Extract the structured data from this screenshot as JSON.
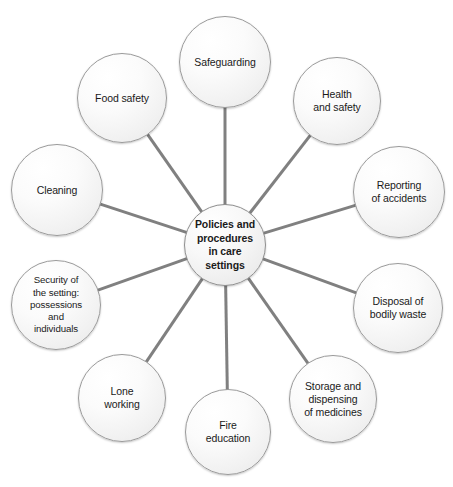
{
  "diagram": {
    "type": "hub-and-spoke-mind-map",
    "center": {
      "id": "center-policies",
      "label": "Policies and\nprocedures\nin care\nsettings",
      "plain_label": "Policies and procedures in care settings",
      "bold": true,
      "cx": 225,
      "cy": 245,
      "r": 41
    },
    "nodes": [
      {
        "id": "safeguarding",
        "label": "Safeguarding",
        "cx": 225,
        "cy": 62,
        "r": 46,
        "angle_deg": 90
      },
      {
        "id": "health-and-safety",
        "label": "Health\nand safety",
        "cx": 337,
        "cy": 101,
        "r": 44,
        "angle_deg": 54
      },
      {
        "id": "reporting-of-accidents",
        "label": "Reporting\nof accidents",
        "cx": 399,
        "cy": 192,
        "r": 46,
        "angle_deg": 18
      },
      {
        "id": "disposal-of-bodily-waste",
        "label": "Disposal of\nbodily waste",
        "cx": 398,
        "cy": 308,
        "r": 45,
        "angle_deg": -18
      },
      {
        "id": "storage-and-dispensing-of-medicines",
        "label": "Storage and\ndispensing\nof medicines",
        "cx": 333,
        "cy": 399,
        "r": 44,
        "angle_deg": -54
      },
      {
        "id": "fire-education",
        "label": "Fire\neducation",
        "cx": 228,
        "cy": 432,
        "r": 43,
        "angle_deg": -90
      },
      {
        "id": "lone-working",
        "label": "Lone\nworking",
        "cx": 122,
        "cy": 398,
        "r": 44,
        "angle_deg": -126
      },
      {
        "id": "security-of-the-setting",
        "label": "Security of\nthe setting:\npossessions\nand\nindividuals",
        "cx": 56,
        "cy": 305,
        "r": 45,
        "angle_deg": -162,
        "small_text": true
      },
      {
        "id": "cleaning",
        "label": "Cleaning",
        "cx": 57,
        "cy": 190,
        "r": 46,
        "angle_deg": 162
      },
      {
        "id": "food-safety",
        "label": "Food safety",
        "cx": 122,
        "cy": 98,
        "r": 45,
        "angle_deg": 126
      }
    ],
    "edges": [
      {
        "from": "center-policies",
        "to": "safeguarding"
      },
      {
        "from": "center-policies",
        "to": "health-and-safety"
      },
      {
        "from": "center-policies",
        "to": "reporting-of-accidents"
      },
      {
        "from": "center-policies",
        "to": "disposal-of-bodily-waste"
      },
      {
        "from": "center-policies",
        "to": "storage-and-dispensing-of-medicines"
      },
      {
        "from": "center-policies",
        "to": "fire-education"
      },
      {
        "from": "center-policies",
        "to": "lone-working"
      },
      {
        "from": "center-policies",
        "to": "security-of-the-setting"
      },
      {
        "from": "center-policies",
        "to": "cleaning"
      },
      {
        "from": "center-policies",
        "to": "food-safety"
      }
    ],
    "style": {
      "background": "#ffffff",
      "node_fill": "#f4f4f4",
      "node_border": "#9a9a9a",
      "edge_color": "#808080",
      "edge_width": 3,
      "text_color": "#1a1a1a"
    }
  }
}
